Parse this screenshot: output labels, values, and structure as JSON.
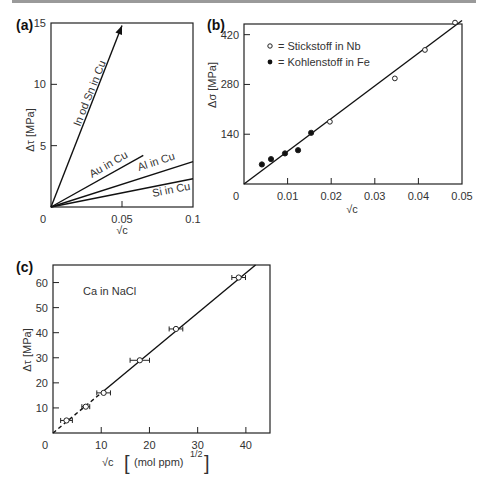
{
  "chart_data": [
    {
      "panel": "(a)",
      "type": "line",
      "xlabel": "√c",
      "ylabel": "Δτ [MPa]",
      "xlim": [
        0,
        0.1
      ],
      "ylim": [
        0,
        15
      ],
      "xticks": [
        0,
        0.05,
        0.1
      ],
      "xtick_labels": [
        "0",
        "0.05",
        "0.1"
      ],
      "yticks": [
        0,
        5,
        10,
        15
      ],
      "ytick_labels": [
        "0",
        "5",
        "10",
        "15"
      ],
      "grid": false,
      "series": [
        {
          "name": "In od Sn in Cu",
          "x": [
            0,
            0.05
          ],
          "y": [
            0,
            14.8
          ],
          "arrow": true
        },
        {
          "name": "Au in Cu",
          "x": [
            0,
            0.065
          ],
          "y": [
            0,
            4.2
          ]
        },
        {
          "name": "Al in Cu",
          "x": [
            0,
            0.1
          ],
          "y": [
            0,
            3.7
          ]
        },
        {
          "name": "Si in Cu",
          "x": [
            0,
            0.1
          ],
          "y": [
            0,
            2.3
          ]
        }
      ]
    },
    {
      "panel": "(b)",
      "type": "scatter",
      "xlabel": "√c",
      "ylabel": "Δσ [MPa]",
      "xlim": [
        0,
        0.05
      ],
      "ylim": [
        0,
        450
      ],
      "xticks": [
        0,
        0.01,
        0.02,
        0.03,
        0.04,
        0.05
      ],
      "xtick_labels": [
        "0",
        "0.01",
        "0.02",
        "0.03",
        "0.04",
        "0.05"
      ],
      "yticks": [
        0,
        140,
        280,
        420
      ],
      "ytick_labels": [
        "0",
        "140",
        "280",
        "420"
      ],
      "grid": false,
      "legend_position": "upper left",
      "series": [
        {
          "name": "= Stickstoff in Nb",
          "marker": "open-circle",
          "x": [
            0.0197,
            0.0346,
            0.0415,
            0.0484
          ],
          "y": [
            175,
            297,
            377,
            454
          ]
        },
        {
          "name": "= Kohlenstoff in Fe",
          "marker": "filled-circle",
          "x": [
            0.0041,
            0.0062,
            0.0094,
            0.0124,
            0.0154
          ],
          "y": [
            55,
            70,
            86,
            95,
            144
          ]
        }
      ],
      "fit_line": {
        "x": [
          0,
          0.05
        ],
        "y": [
          0,
          460
        ]
      }
    },
    {
      "panel": "(c)",
      "type": "scatter",
      "xlabel": "√c  [(mol  ppm)^1/2]",
      "ylabel": "Δτ [MPa]",
      "xlim": [
        0,
        45
      ],
      "ylim": [
        0,
        67
      ],
      "xticks": [
        0,
        10,
        20,
        30,
        40
      ],
      "xtick_labels": [
        "0",
        "10",
        "20",
        "30",
        "40"
      ],
      "yticks": [
        0,
        10,
        20,
        30,
        40,
        50,
        60
      ],
      "ytick_labels": [
        "0",
        "10",
        "20",
        "30",
        "40",
        "50",
        "60"
      ],
      "grid": false,
      "annotation": "Ca in NaCl",
      "series": [
        {
          "name": "Ca in NaCl",
          "marker": "open-circle-xerr",
          "x": [
            2.8,
            6.8,
            10.5,
            18.0,
            25.5,
            38.5
          ],
          "y": [
            5.0,
            10.5,
            16.0,
            29.0,
            41.5,
            62.0
          ],
          "xerr": [
            0.8,
            0.4,
            1.0,
            1.6,
            1.0,
            1.0
          ]
        }
      ],
      "fit_line": {
        "x": [
          0,
          42
        ],
        "y": [
          0,
          67
        ],
        "dashed_until_x": 10
      }
    }
  ],
  "labels": {
    "panel_a": "(a)",
    "panel_b": "(b)",
    "panel_c": "(c)",
    "a_ylabel": "Δτ  [MPa]",
    "a_xlabel": "√c",
    "b_ylabel": "Δσ  [MPa]",
    "b_xlabel": "√c",
    "c_ylabel": "Δτ  [MPa]",
    "c_xlabel_main": "√c",
    "c_xlabel_unit": "(mol  ppm)",
    "c_xlabel_exp": "1/2",
    "a_line1": "In od Sn in Cu",
    "a_line2": "Au in Cu",
    "a_line3": "Al in Cu",
    "a_line4": "Si in Cu",
    "b_legend1": "= Stickstoff in Nb",
    "b_legend2": "= Kohlenstoff in Fe",
    "c_anno": "Ca in NaCl"
  }
}
